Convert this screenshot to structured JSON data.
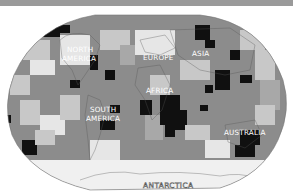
{
  "map": {
    "projection": "world-oval",
    "style": "grayscale-gridded",
    "colors": {
      "ocean_base": "#8c8c8c",
      "light_cell": "#c8c8c8",
      "lighter_cell": "#e6e6e6",
      "dark_cell": "#111111",
      "mid_cell": "#a8a8a8",
      "top_bar": "#9a9a9a",
      "antarctica": "#f0f0f0"
    },
    "labels": [
      {
        "id": "north-america",
        "lines": [
          "NORTH",
          "AMERICA"
        ]
      },
      {
        "id": "europe",
        "lines": [
          "EUROPE"
        ]
      },
      {
        "id": "asia",
        "lines": [
          "ASIA"
        ]
      },
      {
        "id": "africa",
        "lines": [
          "AFRICA"
        ]
      },
      {
        "id": "south-america",
        "lines": [
          "SOUTH",
          "AMERICA"
        ]
      },
      {
        "id": "australia",
        "lines": [
          "AUSTRALIA"
        ]
      },
      {
        "id": "antarctica",
        "lines": [
          "ANTARCTICA"
        ]
      }
    ]
  }
}
